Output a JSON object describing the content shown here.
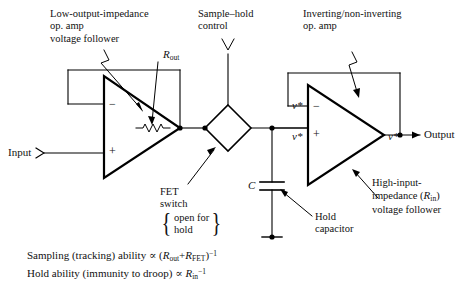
{
  "figure": {
    "title_semantic": "sample-and-hold circuit schematic",
    "ink_color": "#000000",
    "background_color": "#ffffff"
  },
  "annotations": {
    "left_opamp": {
      "line1": "Low-output-impedance",
      "line2": "op. amp",
      "line3": "voltage follower"
    },
    "sample_hold_control": {
      "line1": "Sample–hold",
      "line2": "control"
    },
    "right_opamp": {
      "line1": "Inverting/non-inverting",
      "line2": "op. amp"
    },
    "fet_switch": {
      "line1": "FET",
      "line2": "switch",
      "brace_line1": "open for",
      "brace_line2": "hold",
      "brace_left": "{",
      "brace_right": "}"
    },
    "hold_capacitor": {
      "line1": "Hold",
      "line2": "capacitor"
    },
    "high_input_impedance": {
      "line1": "High-input-",
      "line2_pre": "impedance (",
      "line2_sym": "R",
      "line2_sub": "in",
      "line2_post": ")",
      "line3": "voltage follower"
    }
  },
  "labels": {
    "r_out": {
      "sym": "R",
      "sub": "out"
    },
    "capacitor": {
      "sym": "C"
    },
    "input": "Input",
    "output": "Output",
    "opamp_minus": "−",
    "opamp_plus": "+",
    "v_star": "v*"
  },
  "node_labels": {
    "right_minus_input": "v*",
    "right_plus_input": "v*",
    "right_output": "v*"
  },
  "formulas": {
    "line1": {
      "text_pre": "Sampling (tracking) ability ",
      "prop": "∝",
      "open_paren": "(",
      "sym1": "R",
      "sub1": "out",
      "plus": "+",
      "sym2": "R",
      "sub2": "FET",
      "close_paren": ")",
      "exponent": "−1"
    },
    "line2": {
      "text_pre": "Hold ability (immunity to droop) ",
      "prop": "∝",
      "sym1": "R",
      "sub1": "in",
      "exponent": "−1"
    }
  }
}
